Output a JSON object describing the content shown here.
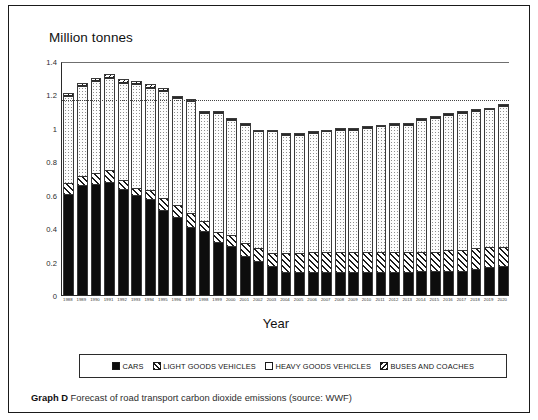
{
  "figure": {
    "y_axis_title": "Million tonnes",
    "x_axis_title": "Year",
    "y_ticks": [
      "0",
      "0.2",
      "0.4",
      "0.6",
      "0.8",
      "1",
      "1.2",
      "1.4"
    ]
  },
  "legend": {
    "items": [
      {
        "label": "CARS",
        "swatch": "solid-black-swatch"
      },
      {
        "label": "LIGHT GOODS VEHICLES",
        "swatch": "forward-hatch-swatch"
      },
      {
        "label": "HEAVY GOODS VEHICLES",
        "swatch": "dotted-white-swatch"
      },
      {
        "label": "BUSES AND COACHES",
        "swatch": "back-hatch-swatch"
      }
    ]
  },
  "caption": {
    "label": "Graph D",
    "text": " Forecast of road transport carbon dioxide emissions (source: WWF)"
  },
  "chart_data": {
    "type": "bar",
    "stacked": true,
    "title": "",
    "subtitle": "",
    "xlabel": "Year",
    "ylabel": "Million tonnes",
    "ylim": [
      0,
      1.4
    ],
    "ytick_step": 0.2,
    "grid": "dotted-fill-only",
    "legend_position": "bottom",
    "reference_line": {
      "value": 1.18,
      "style": "dotted",
      "label": ""
    },
    "categories": [
      "1988",
      "1989",
      "1990",
      "1991",
      "1992",
      "1993",
      "1994",
      "1995",
      "1996",
      "1997",
      "1998",
      "1999",
      "2000",
      "2001",
      "2002",
      "2003",
      "2004",
      "2005",
      "2006",
      "2007",
      "2008",
      "2009",
      "2010",
      "2011",
      "2012",
      "2013",
      "2014",
      "2015",
      "2016",
      "2017",
      "2018",
      "2019",
      "2020"
    ],
    "series": [
      {
        "name": "CARS",
        "values": [
          0.6,
          0.65,
          0.66,
          0.67,
          0.63,
          0.59,
          0.57,
          0.5,
          0.46,
          0.4,
          0.38,
          0.31,
          0.29,
          0.23,
          0.2,
          0.17,
          0.13,
          0.13,
          0.13,
          0.13,
          0.13,
          0.13,
          0.13,
          0.13,
          0.13,
          0.13,
          0.14,
          0.14,
          0.14,
          0.14,
          0.15,
          0.16,
          0.17
        ]
      },
      {
        "name": "LIGHT GOODS VEHICLES",
        "values": [
          0.07,
          0.06,
          0.07,
          0.08,
          0.06,
          0.05,
          0.06,
          0.08,
          0.08,
          0.09,
          0.06,
          0.07,
          0.07,
          0.08,
          0.08,
          0.08,
          0.12,
          0.12,
          0.13,
          0.13,
          0.13,
          0.13,
          0.13,
          0.13,
          0.13,
          0.13,
          0.12,
          0.12,
          0.13,
          0.13,
          0.13,
          0.13,
          0.12
        ]
      },
      {
        "name": "HEAVY GOODS VEHICLES",
        "values": [
          0.52,
          0.54,
          0.55,
          0.55,
          0.58,
          0.62,
          0.61,
          0.64,
          0.64,
          0.67,
          0.65,
          0.71,
          0.69,
          0.71,
          0.7,
          0.73,
          0.71,
          0.71,
          0.71,
          0.72,
          0.73,
          0.73,
          0.74,
          0.75,
          0.76,
          0.76,
          0.79,
          0.8,
          0.81,
          0.82,
          0.82,
          0.82,
          0.84
        ]
      },
      {
        "name": "BUSES AND COACHES",
        "values": [
          0.02,
          0.02,
          0.02,
          0.02,
          0.02,
          0.02,
          0.02,
          0.02,
          0.01,
          0.01,
          0.01,
          0.01,
          0.01,
          0.01,
          0.01,
          0.01,
          0.01,
          0.01,
          0.01,
          0.01,
          0.01,
          0.01,
          0.01,
          0.01,
          0.01,
          0.01,
          0.01,
          0.01,
          0.01,
          0.01,
          0.01,
          0.01,
          0.01
        ]
      }
    ],
    "totals": [
      1.21,
      1.27,
      1.3,
      1.32,
      1.29,
      1.28,
      1.26,
      1.24,
      1.19,
      1.17,
      1.1,
      1.1,
      1.06,
      1.03,
      0.99,
      0.99,
      0.97,
      0.97,
      0.98,
      0.99,
      1.0,
      1.0,
      1.01,
      1.02,
      1.03,
      1.03,
      1.06,
      1.07,
      1.09,
      1.1,
      1.11,
      1.12,
      1.14
    ]
  }
}
